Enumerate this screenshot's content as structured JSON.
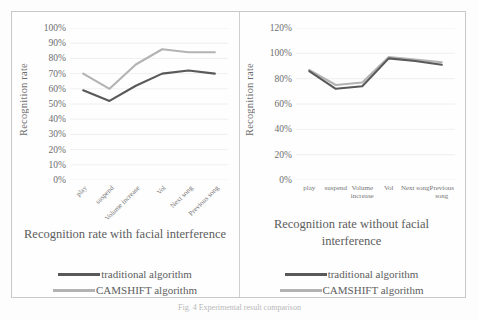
{
  "figure": {
    "caption": "Fig. 4   Experimental result comparison"
  },
  "panels": [
    {
      "id": "with-interference",
      "title": "Recognition rate with facial interference",
      "axis_title_y": "Recognition rate",
      "legend": [
        {
          "label": "traditional algorithm",
          "color": "#595959"
        },
        {
          "label": "CAMSHIFT algorithm",
          "color": "#b3b3b3"
        }
      ],
      "chart_data": {
        "type": "line",
        "title": "Recognition rate with facial interference",
        "xlabel": "",
        "ylabel": "Recognition rate",
        "ylim": [
          0,
          100
        ],
        "ytick_step": 10,
        "ytick_labels": [
          "0%",
          "10%",
          "20%",
          "30%",
          "40%",
          "50%",
          "60%",
          "70%",
          "80%",
          "90%",
          "100%"
        ],
        "grid": true,
        "legend_position": "below",
        "label_rotation": -45,
        "categories": [
          "play",
          "suspend",
          "Volume increase",
          "Vol",
          "Next song",
          "Previous song"
        ],
        "series": [
          {
            "name": "traditional algorithm",
            "color": "#595959",
            "values": [
              59,
              52,
              62,
              70,
              72,
              70
            ]
          },
          {
            "name": "CAMSHIFT algorithm",
            "color": "#b3b3b3",
            "values": [
              70,
              60,
              76,
              86,
              84,
              84
            ]
          }
        ]
      }
    },
    {
      "id": "without-interference",
      "title": "Recognition rate without facial interference",
      "axis_title_y": "Recognition rate",
      "legend": [
        {
          "label": "traditional algorithm",
          "color": "#595959"
        },
        {
          "label": "CAMSHIFT algorithm",
          "color": "#b3b3b3"
        }
      ],
      "chart_data": {
        "type": "line",
        "title": "Recognition rate without facial interference",
        "xlabel": "",
        "ylabel": "Recognition rate",
        "ylim": [
          0,
          120
        ],
        "ytick_step": 20,
        "ytick_labels": [
          "0%",
          "20%",
          "40%",
          "60%",
          "80%",
          "100%",
          "120%"
        ],
        "grid": true,
        "legend_position": "below",
        "label_rotation": 0,
        "categories": [
          "play",
          "suspend",
          "Volume increase",
          "Vol",
          "Next song",
          "Previous song"
        ],
        "series": [
          {
            "name": "traditional algorithm",
            "color": "#595959",
            "values": [
              86,
              72,
              74,
              96,
              94,
              91
            ]
          },
          {
            "name": "CAMSHIFT algorithm",
            "color": "#b3b3b3",
            "values": [
              87,
              75,
              77,
              97,
              95,
              93
            ]
          }
        ]
      }
    }
  ]
}
